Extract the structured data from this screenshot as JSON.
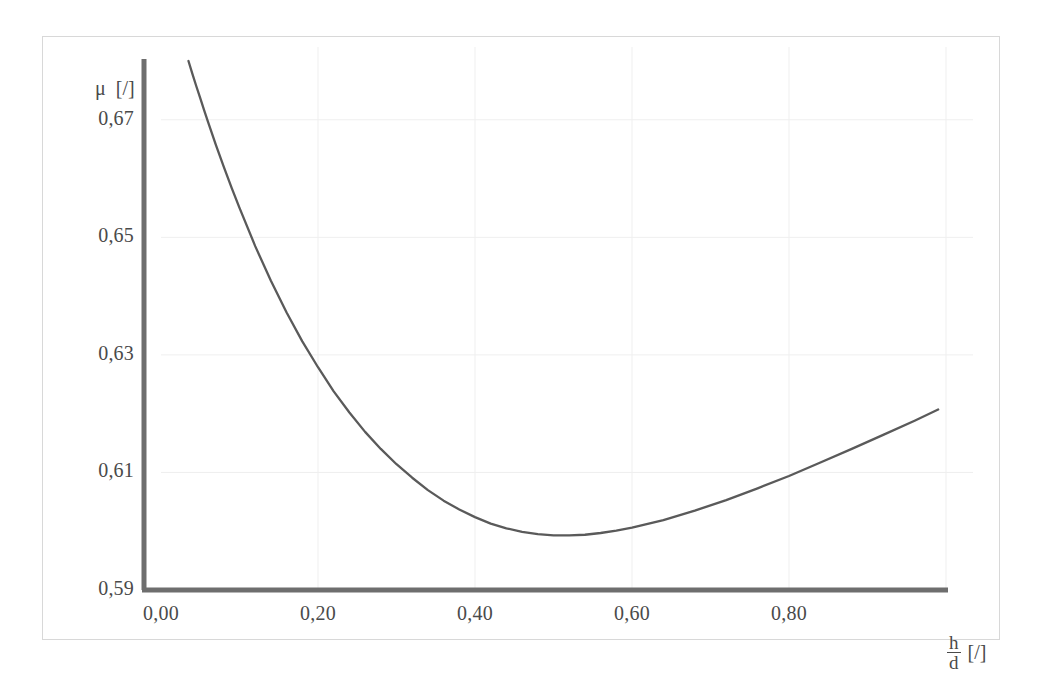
{
  "chart_data": {
    "type": "line",
    "title": "",
    "subtitle": "",
    "xlabel": "h/d [/]",
    "xlabel_numerator": "h",
    "xlabel_denominator": "d",
    "xlabel_unit": "[/]",
    "ylabel": "μ [/]",
    "ylabel_symbol": "μ",
    "ylabel_unit": "[/]",
    "xlim": [
      0.0,
      1.0
    ],
    "ylim": [
      0.59,
      0.68
    ],
    "xticks": [
      0.0,
      0.2,
      0.4,
      0.6,
      0.8
    ],
    "yticks": [
      0.59,
      0.61,
      0.63,
      0.65,
      0.67
    ],
    "xticklabels": [
      "0,00",
      "0,20",
      "0,40",
      "0,60",
      "0,80"
    ],
    "yticklabels": [
      "0,59",
      "0,61",
      "0,63",
      "0,65",
      "0,67"
    ],
    "grid": true,
    "grid_color": "#efefef",
    "legend": false,
    "legend_position": "none",
    "axis_color": "#6e6e6e",
    "line_color": "#5a5a5a",
    "series": [
      {
        "name": "discharge coefficient",
        "x": [
          0.035,
          0.04,
          0.045,
          0.05,
          0.055,
          0.06,
          0.07,
          0.08,
          0.09,
          0.1,
          0.12,
          0.14,
          0.16,
          0.18,
          0.2,
          0.22,
          0.24,
          0.26,
          0.28,
          0.3,
          0.32,
          0.34,
          0.36,
          0.38,
          0.4,
          0.42,
          0.44,
          0.46,
          0.48,
          0.5,
          0.52,
          0.54,
          0.56,
          0.58,
          0.6,
          0.64,
          0.68,
          0.72,
          0.76,
          0.8,
          0.84,
          0.88,
          0.92,
          0.96,
          0.99
        ],
        "y": [
          0.68,
          0.6778,
          0.6757,
          0.6737,
          0.6716,
          0.6696,
          0.6657,
          0.662,
          0.6584,
          0.655,
          0.6485,
          0.6426,
          0.6372,
          0.6323,
          0.6279,
          0.6238,
          0.6202,
          0.6169,
          0.614,
          0.6114,
          0.6091,
          0.607,
          0.6052,
          0.6037,
          0.6024,
          0.6013,
          0.6005,
          0.5999,
          0.5995,
          0.5993,
          0.5993,
          0.5994,
          0.5997,
          0.6001,
          0.6006,
          0.6019,
          0.6035,
          0.6053,
          0.6073,
          0.6094,
          0.6117,
          0.614,
          0.6164,
          0.6188,
          0.6207
        ]
      }
    ]
  }
}
